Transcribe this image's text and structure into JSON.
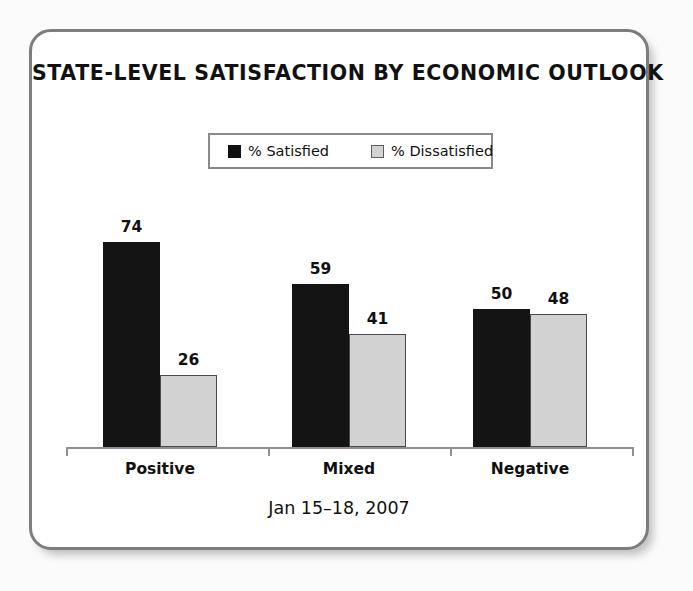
{
  "chart_data": {
    "type": "bar",
    "title": "STATE-LEVEL SATISFACTION BY ECONOMIC OUTLOOK",
    "subtitle": "Jan 15–18, 2007",
    "xlabel": "",
    "ylabel": "",
    "ylim": [
      0,
      100
    ],
    "grid": false,
    "legend_position": "top-center",
    "categories": [
      "Positive",
      "Mixed",
      "Negative"
    ],
    "series": [
      {
        "name": "% Satisfied",
        "color": "#141414",
        "values": [
          74,
          59,
          50
        ]
      },
      {
        "name": "% Dissatisfied",
        "color": "#d2d2d2",
        "values": [
          26,
          41,
          48
        ]
      }
    ]
  },
  "frame": {
    "border_color": "#7d7d7d",
    "background": "#ffffff"
  },
  "legend": {
    "items": [
      {
        "label": "% Satisfied",
        "swatch": "dark-square-swatch"
      },
      {
        "label": "% Dissatisfied",
        "swatch": "light-square-swatch"
      }
    ]
  },
  "axis": {
    "line_color": "#8f8f8f"
  }
}
